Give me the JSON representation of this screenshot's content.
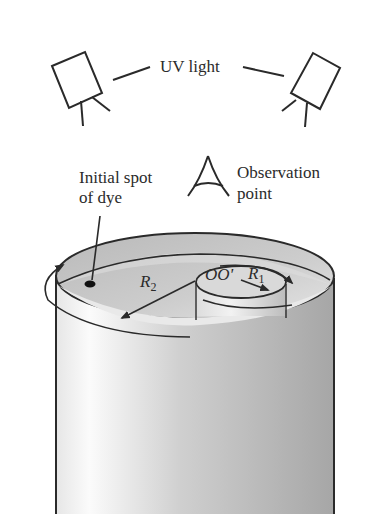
{
  "figure": {
    "labels": {
      "uv_light": "UV light",
      "initial_spot_line1": "Initial spot",
      "initial_spot_line2": "of dye",
      "observation_line1": "Observation",
      "observation_line2": "point",
      "outer_radius": "R",
      "outer_radius_sub": "2",
      "inner_radius": "R",
      "inner_radius_sub": "1",
      "axis_label": "OO'"
    },
    "components": [
      "uv-lamp-left",
      "uv-lamp-right",
      "observation-eye",
      "outer-cylinder",
      "inner-cylinder",
      "dye-spot",
      "rotation-arrow-outer",
      "rotation-arrow-inner"
    ],
    "colors": {
      "line": "#2a2a2a",
      "fluid_surface": "#c4c4c4",
      "cylinder_light": "#f4f4f4",
      "cylinder_dark": "#a9a9a9"
    }
  }
}
